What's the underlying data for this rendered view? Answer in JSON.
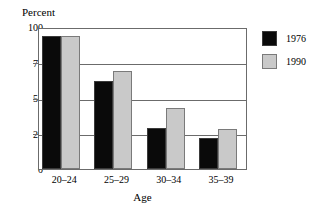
{
  "chart_data": {
    "type": "bar",
    "title": "",
    "xlabel": "Age",
    "ylabel": "Percent",
    "categories": [
      "20–24",
      "25–29",
      "30–34",
      "35–39"
    ],
    "series": [
      {
        "name": "1976",
        "color": "#0a0a0a",
        "values": [
          94,
          62,
          29,
          22
        ]
      },
      {
        "name": "1990",
        "color": "#c9c9c9",
        "values": [
          94,
          69,
          43,
          28
        ]
      }
    ],
    "ylim": [
      0,
      100
    ],
    "yticks": [
      0,
      25,
      50,
      75,
      100
    ],
    "ytick_labels": [
      "0",
      "25",
      "50",
      "75",
      "100"
    ],
    "grid": true,
    "legend_position": "right"
  },
  "axes": {
    "y_title": "Percent",
    "x_title": "Age"
  },
  "legend": {
    "entries": [
      {
        "label": "1976",
        "color": "#0a0a0a"
      },
      {
        "label": "1990",
        "color": "#c9c9c9"
      }
    ]
  },
  "colors": {
    "series_1976": "#0a0a0a",
    "series_1990": "#c9c9c9",
    "axis": "#6b6b6b",
    "background": "#ffffff"
  }
}
